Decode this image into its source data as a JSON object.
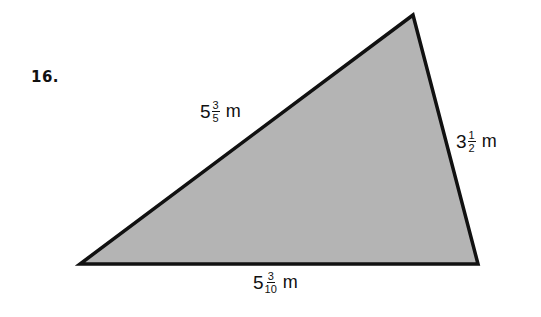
{
  "problem": {
    "number": "16."
  },
  "figure": {
    "shape": "triangle",
    "fill_color": "#b4b4b4",
    "stroke_color": "#111111",
    "vertices": {
      "top": [
        413,
        15
      ],
      "bottom_left": [
        80,
        264
      ],
      "bottom_right": [
        478,
        264
      ]
    },
    "sides": {
      "left": {
        "whole": "5",
        "numerator": "3",
        "denominator": "5",
        "unit": "m"
      },
      "right": {
        "whole": "3",
        "numerator": "1",
        "denominator": "2",
        "unit": "m"
      },
      "bottom": {
        "whole": "5",
        "numerator": "3",
        "denominator": "10",
        "unit": "m"
      }
    }
  }
}
